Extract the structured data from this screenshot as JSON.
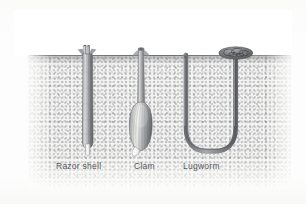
{
  "figure": {
    "kind": "scientific-illustration",
    "background_color": "#fdfdfc",
    "sediment_color": "#f2f2f1",
    "ink_color": "#55565a",
    "surface_label": ""
  },
  "labels": {
    "razor_shell": "Razor shell",
    "clam": "Clam",
    "lugworm": "Lugworm"
  },
  "organisms": [
    {
      "id": "razor-shell",
      "label": "Razor shell",
      "form": "long narrow vertical tube with flared siphons at the surface and a pale foot at the base"
    },
    {
      "id": "clam",
      "label": "Clam",
      "form": "slender siphon tube descending to a ribbed bulbous shell with a pale protruding foot"
    },
    {
      "id": "lugworm",
      "label": "Lugworm",
      "form": "U-shaped burrow with a coiled cast mound at the surface on the right shaft"
    }
  ]
}
